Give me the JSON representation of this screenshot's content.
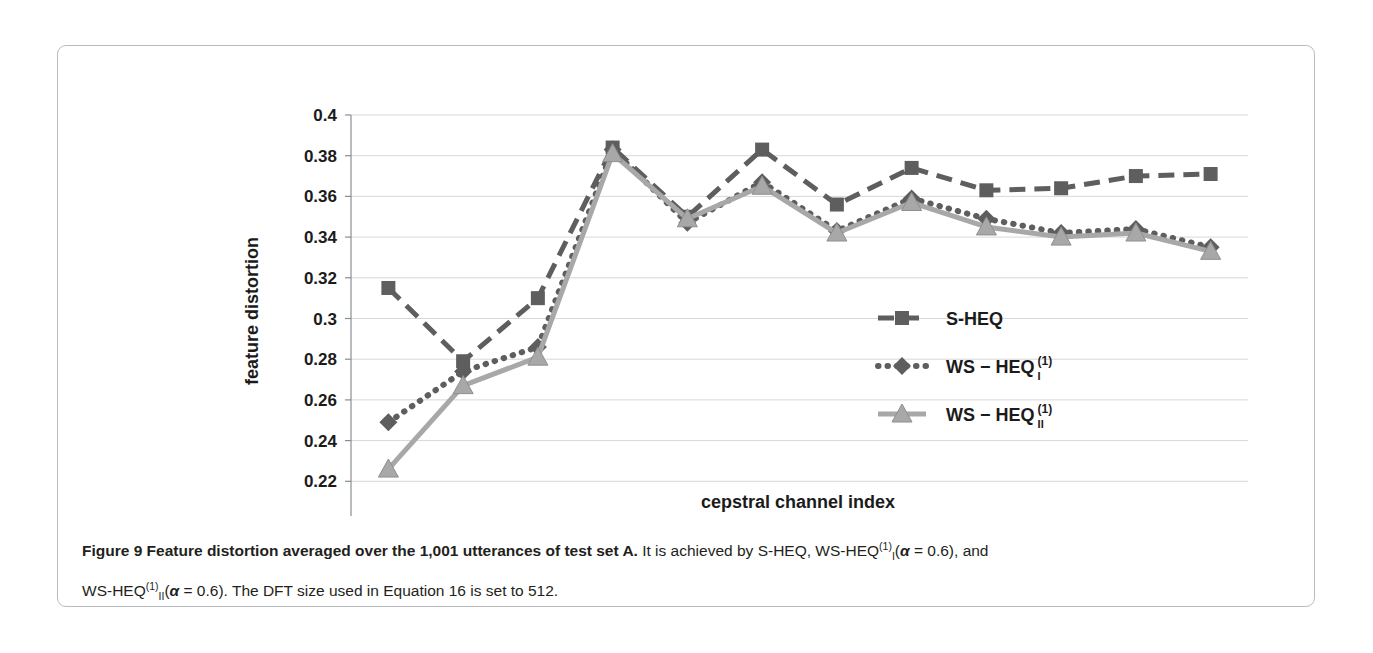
{
  "figure": {
    "label": "Figure 9",
    "caption_bold": "Feature distortion averaged over the 1,001 utterances of test set A.",
    "caption_rest_1": " It is achieved by S-HEQ, WS-HEQ",
    "caption_sup_1": "(1)",
    "caption_sub_1": "I",
    "caption_rest_2": "(",
    "caption_alpha_1": "α",
    "caption_rest_3": " = 0.6), and",
    "line2_prefix": "WS-HEQ",
    "line2_sup": "(1)",
    "line2_sub": "II",
    "line2_paren_open": "(",
    "line2_alpha": "α",
    "line2_rest": " = 0.6). The DFT size used in Equation 16 is set to 512."
  },
  "chart_data": {
    "type": "line",
    "title": "",
    "xlabel": "cepstral channel index",
    "ylabel": "feature distortion",
    "categories": [
      1,
      2,
      3,
      4,
      5,
      6,
      7,
      8,
      9,
      10,
      11,
      12
    ],
    "xtick_labels": [
      "1",
      "2",
      "3",
      "4",
      "5",
      "6",
      "7",
      "8",
      "9",
      "10",
      "11",
      "12"
    ],
    "ytick_labels": [
      "0.2",
      "0.22",
      "0.24",
      "0.26",
      "0.28",
      "0.3",
      "0.32",
      "0.34",
      "0.36",
      "0.38",
      "0.4"
    ],
    "ytick_values": [
      0.2,
      0.22,
      0.24,
      0.26,
      0.28,
      0.3,
      0.32,
      0.34,
      0.36,
      0.38,
      0.4
    ],
    "ylim": [
      0.2,
      0.4
    ],
    "xlim": [
      0.5,
      12.5
    ],
    "grid": true,
    "legend_position": "inside-right",
    "series": [
      {
        "name": "S-HEQ",
        "legend_text": "S-HEQ",
        "legend_sup": "",
        "legend_sub": "",
        "marker": "square",
        "line_style": "dashed",
        "color": "#5e5e5e",
        "values": [
          0.315,
          0.279,
          0.31,
          0.384,
          0.35,
          0.383,
          0.356,
          0.374,
          0.363,
          0.364,
          0.37,
          0.371
        ]
      },
      {
        "name": "WS-HEQ_I^(1)",
        "legend_text": "WS − HEQ",
        "legend_sup": "(1)",
        "legend_sub": "I",
        "marker": "diamond",
        "line_style": "dotted",
        "color": "#5e5e5e",
        "values": [
          0.249,
          0.274,
          0.286,
          0.383,
          0.347,
          0.367,
          0.343,
          0.359,
          0.349,
          0.342,
          0.344,
          0.335
        ]
      },
      {
        "name": "WS-HEQ_II^(1)",
        "legend_text": "WS − HEQ",
        "legend_sup": "(1)",
        "legend_sub": "II",
        "marker": "triangle",
        "line_style": "solid",
        "color": "#a8a8a8",
        "values": [
          0.226,
          0.267,
          0.281,
          0.381,
          0.349,
          0.365,
          0.342,
          0.357,
          0.345,
          0.34,
          0.342,
          0.333
        ]
      }
    ],
    "colors": {
      "series1": "#5e5e5e",
      "series2": "#5e5e5e",
      "series3": "#a8a8a8",
      "grid": "#d6d8da",
      "axis": "#8a8d8f",
      "text": "#1b1b1b"
    }
  }
}
